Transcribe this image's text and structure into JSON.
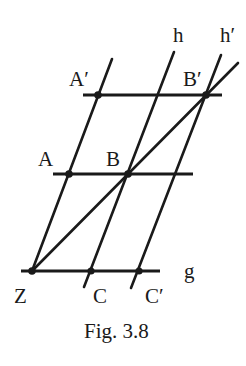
{
  "figure": {
    "caption": "Fig. 3.8",
    "labels": {
      "A_prime": "A′",
      "B_prime": "B′",
      "A": "A",
      "B": "B",
      "h": "h",
      "h_prime": "h′",
      "g": "g",
      "Z": "Z",
      "C": "C",
      "C_prime": "C′"
    },
    "points": {
      "A_prime": [
        98,
        95
      ],
      "B_prime": [
        206,
        95
      ],
      "A": [
        69,
        174
      ],
      "B": [
        128,
        174
      ],
      "Z": [
        32,
        271
      ],
      "C": [
        91,
        271
      ],
      "C_prime": [
        139,
        271
      ]
    },
    "lines": {
      "top_horizontal": [
        [
          83,
          95
        ],
        [
          222,
          95
        ]
      ],
      "middle_horizontal": [
        [
          53,
          174
        ],
        [
          193,
          174
        ]
      ],
      "g": [
        [
          21,
          271
        ],
        [
          160,
          271
        ]
      ],
      "line_ZA": [
        [
          32,
          271
        ],
        [
          112,
          59
        ]
      ],
      "h": [
        [
          84,
          286
        ],
        [
          174,
          52
        ]
      ],
      "h_prime": [
        [
          131,
          287
        ],
        [
          221,
          55
        ]
      ],
      "diagonal_ZB": [
        [
          32,
          271
        ],
        [
          238,
          63
        ]
      ]
    },
    "colors": {
      "ink": "#1a1a1a",
      "background": "#ffffff"
    }
  }
}
